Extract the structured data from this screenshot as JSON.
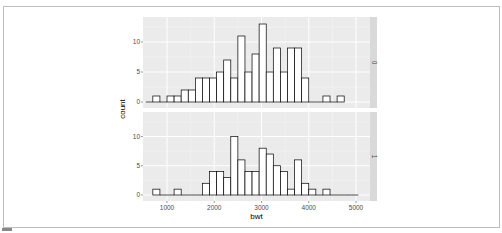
{
  "chart_data": {
    "type": "bar",
    "subtype": "histogram",
    "facet": "rows",
    "xlabel": "bwt",
    "ylabel": "count",
    "x_ticks": [
      1000,
      2000,
      3000,
      4000,
      5000
    ],
    "y_ticks": [
      0,
      5,
      10
    ],
    "ylim": [
      0,
      13.5
    ],
    "xlim": [
      550,
      5200
    ],
    "bin_start": 700,
    "bin_width": 150,
    "grid": true,
    "panels": [
      {
        "strip_label": "0",
        "values": [
          0,
          1,
          0,
          1,
          1,
          2,
          2,
          4,
          4,
          4,
          5,
          7,
          4,
          11,
          5,
          8,
          13,
          5,
          9,
          5,
          9,
          9,
          4,
          0,
          0,
          1,
          0,
          1
        ],
        "start": 550
      },
      {
        "strip_label": "1",
        "values": [
          1,
          0,
          0,
          1,
          0,
          0,
          0,
          2,
          4,
          4,
          3,
          10,
          6,
          4,
          4,
          8,
          7,
          5,
          4,
          1,
          6,
          2,
          1,
          0,
          1,
          0,
          0,
          0,
          0
        ],
        "start": 700
      }
    ]
  }
}
